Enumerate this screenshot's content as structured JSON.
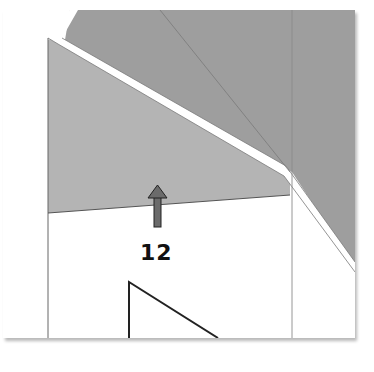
{
  "diagram": {
    "label": "12",
    "colors": {
      "background": "#ffffff",
      "wall_face": "#b3b3b3",
      "dark_region": "#9d9d9d",
      "edge_line": "#555555",
      "arrow": "#6b6b6b",
      "text": "#111111"
    }
  }
}
